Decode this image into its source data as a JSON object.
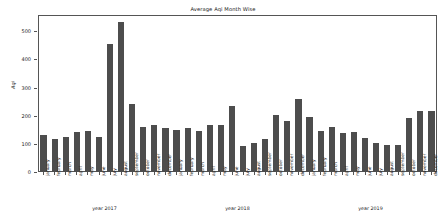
{
  "chart_data": {
    "type": "bar",
    "title": "Average Aqi Month Wise",
    "xlabel": "",
    "ylabel": "Aqi",
    "ylim": [
      0,
      560
    ],
    "yticks": [
      0,
      100,
      200,
      300,
      400,
      500
    ],
    "grid": false,
    "legend": null,
    "bar_color": "#4d4d4d",
    "categories": [
      "january",
      "february",
      "march",
      "april",
      "may",
      "june",
      "july",
      "august",
      "september",
      "october",
      "november",
      "december",
      "january",
      "february",
      "march",
      "april",
      "may",
      "june",
      "july",
      "august",
      "september",
      "october",
      "november",
      "december",
      "january",
      "february",
      "march",
      "april",
      "may",
      "june",
      "july",
      "august",
      "september",
      "october",
      "november",
      "december"
    ],
    "values": [
      133,
      118,
      124,
      141,
      148,
      124,
      458,
      536,
      242,
      160,
      167,
      157,
      150,
      158,
      146,
      167,
      168,
      237,
      93,
      103,
      117,
      205,
      183,
      259,
      198,
      148,
      161,
      138,
      141,
      122,
      105,
      98,
      97,
      194,
      216,
      218
    ],
    "groups": [
      {
        "label": "year 2017",
        "start_index": 0,
        "end_index": 11
      },
      {
        "label": "year 2018",
        "start_index": 12,
        "end_index": 23
      },
      {
        "label": "year 2019",
        "start_index": 24,
        "end_index": 35
      }
    ]
  }
}
